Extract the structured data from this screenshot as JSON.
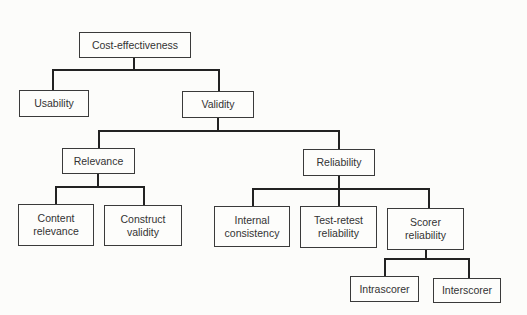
{
  "diagram": {
    "title": "",
    "nodes": {
      "cost_effectiveness": "Cost-effectiveness",
      "usability": "Usability",
      "validity": "Validity",
      "relevance": "Relevance",
      "reliability": "Reliability",
      "content_relevance": "Content\nrelevance",
      "construct_validity": "Construct\nvalidity",
      "internal_consistency": "Internal\nconsistency",
      "test_retest_reliability": "Test-retest\nreliability",
      "scorer_reliability": "Scorer\nreliability",
      "intrascorer": "Intrascorer",
      "interscorer": "Interscorer"
    },
    "edges": [
      [
        "cost_effectiveness",
        "usability"
      ],
      [
        "cost_effectiveness",
        "validity"
      ],
      [
        "validity",
        "relevance"
      ],
      [
        "validity",
        "reliability"
      ],
      [
        "relevance",
        "content_relevance"
      ],
      [
        "relevance",
        "construct_validity"
      ],
      [
        "reliability",
        "internal_consistency"
      ],
      [
        "reliability",
        "test_retest_reliability"
      ],
      [
        "reliability",
        "scorer_reliability"
      ],
      [
        "scorer_reliability",
        "intrascorer"
      ],
      [
        "scorer_reliability",
        "interscorer"
      ]
    ]
  }
}
